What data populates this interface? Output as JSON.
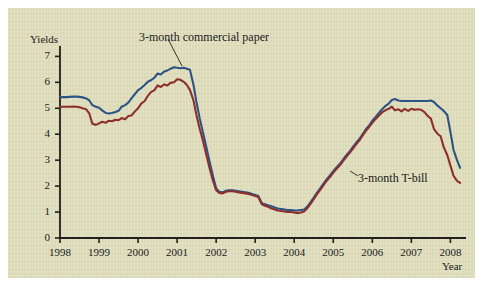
{
  "chart_data": {
    "type": "line",
    "title": "",
    "xlabel": "Year",
    "ylabel": "Yields",
    "xlim": [
      1998,
      2008.4
    ],
    "ylim": [
      0,
      7.4
    ],
    "grid": false,
    "legend_position": "inline-annotations",
    "xticks": [
      "1998",
      "1999",
      "2000",
      "2001",
      "2002",
      "2003",
      "2004",
      "2005",
      "2006",
      "2007",
      "2008"
    ],
    "yticks": [
      "0",
      "1",
      "2",
      "3",
      "4",
      "5",
      "6",
      "7"
    ],
    "annotations": [
      {
        "text": "3-month commercial paper",
        "series": "3-month commercial paper"
      },
      {
        "text": "3-month T-bill",
        "series": "3-month T-bill"
      }
    ],
    "x": [
      1998.0,
      1998.08,
      1998.17,
      1998.25,
      1998.33,
      1998.42,
      1998.5,
      1998.58,
      1998.67,
      1998.75,
      1998.83,
      1998.92,
      1999.0,
      1999.08,
      1999.17,
      1999.25,
      1999.33,
      1999.42,
      1999.5,
      1999.58,
      1999.67,
      1999.75,
      1999.83,
      1999.92,
      2000.0,
      2000.08,
      2000.17,
      2000.25,
      2000.33,
      2000.42,
      2000.5,
      2000.58,
      2000.67,
      2000.75,
      2000.83,
      2000.92,
      2001.0,
      2001.08,
      2001.17,
      2001.25,
      2001.33,
      2001.42,
      2001.5,
      2001.58,
      2001.67,
      2001.75,
      2001.83,
      2001.92,
      2002.0,
      2002.08,
      2002.17,
      2002.25,
      2002.33,
      2002.42,
      2002.5,
      2002.58,
      2002.67,
      2002.75,
      2002.83,
      2002.92,
      2003.0,
      2003.08,
      2003.17,
      2003.25,
      2003.33,
      2003.42,
      2003.5,
      2003.58,
      2003.67,
      2003.75,
      2003.83,
      2003.92,
      2004.0,
      2004.08,
      2004.17,
      2004.25,
      2004.33,
      2004.42,
      2004.5,
      2004.58,
      2004.67,
      2004.75,
      2004.83,
      2004.92,
      2005.0,
      2005.08,
      2005.17,
      2005.25,
      2005.33,
      2005.42,
      2005.5,
      2005.58,
      2005.67,
      2005.75,
      2005.83,
      2005.92,
      2006.0,
      2006.08,
      2006.17,
      2006.25,
      2006.33,
      2006.42,
      2006.5,
      2006.58,
      2006.67,
      2006.75,
      2006.83,
      2006.92,
      2007.0,
      2007.08,
      2007.17,
      2007.25,
      2007.33,
      2007.42,
      2007.5,
      2007.58,
      2007.67,
      2007.75,
      2007.83,
      2007.92,
      2008.0,
      2008.08,
      2008.17,
      2008.25
    ],
    "series": [
      {
        "name": "3-month commercial paper",
        "color": "#2b5485",
        "values": [
          5.42,
          5.43,
          5.43,
          5.44,
          5.45,
          5.45,
          5.44,
          5.42,
          5.38,
          5.3,
          5.12,
          5.06,
          5.02,
          4.92,
          4.82,
          4.8,
          4.82,
          4.86,
          4.9,
          5.06,
          5.12,
          5.22,
          5.38,
          5.55,
          5.7,
          5.78,
          5.9,
          6.02,
          6.08,
          6.18,
          6.34,
          6.3,
          6.42,
          6.46,
          6.52,
          6.58,
          6.56,
          6.54,
          6.56,
          6.52,
          6.48,
          5.9,
          5.2,
          4.6,
          4.02,
          3.5,
          2.95,
          2.38,
          1.92,
          1.78,
          1.76,
          1.82,
          1.84,
          1.84,
          1.82,
          1.8,
          1.78,
          1.76,
          1.74,
          1.7,
          1.66,
          1.62,
          1.34,
          1.3,
          1.26,
          1.22,
          1.18,
          1.14,
          1.12,
          1.1,
          1.08,
          1.08,
          1.06,
          1.06,
          1.08,
          1.1,
          1.2,
          1.38,
          1.56,
          1.74,
          1.92,
          2.1,
          2.26,
          2.42,
          2.58,
          2.72,
          2.86,
          3.02,
          3.18,
          3.34,
          3.5,
          3.66,
          3.82,
          4.0,
          4.18,
          4.34,
          4.52,
          4.66,
          4.82,
          4.96,
          5.08,
          5.18,
          5.32,
          5.36,
          5.3,
          5.28,
          5.28,
          5.28,
          5.28,
          5.28,
          5.28,
          5.28,
          5.28,
          5.28,
          5.3,
          5.24,
          5.1,
          5.0,
          4.9,
          4.74,
          4.1,
          3.4,
          3.0,
          2.7
        ]
      },
      {
        "name": "3-month T-bill",
        "color": "#8d2f2c",
        "values": [
          5.05,
          5.06,
          5.06,
          5.06,
          5.07,
          5.06,
          5.04,
          5.0,
          4.96,
          4.8,
          4.4,
          4.36,
          4.42,
          4.48,
          4.44,
          4.52,
          4.5,
          4.56,
          4.54,
          4.62,
          4.58,
          4.7,
          4.72,
          4.88,
          5.0,
          5.18,
          5.28,
          5.48,
          5.62,
          5.7,
          5.88,
          5.82,
          5.92,
          5.88,
          5.98,
          6.0,
          6.12,
          6.1,
          6.02,
          5.9,
          5.7,
          5.3,
          4.7,
          4.2,
          3.7,
          3.2,
          2.7,
          2.2,
          1.84,
          1.74,
          1.72,
          1.78,
          1.8,
          1.8,
          1.78,
          1.76,
          1.74,
          1.72,
          1.7,
          1.66,
          1.62,
          1.58,
          1.3,
          1.24,
          1.2,
          1.14,
          1.1,
          1.06,
          1.04,
          1.02,
          1.0,
          1.0,
          0.98,
          0.96,
          0.98,
          1.02,
          1.14,
          1.32,
          1.5,
          1.68,
          1.86,
          2.04,
          2.2,
          2.36,
          2.52,
          2.66,
          2.8,
          2.96,
          3.12,
          3.28,
          3.44,
          3.6,
          3.76,
          3.94,
          4.12,
          4.28,
          4.44,
          4.58,
          4.72,
          4.84,
          4.92,
          4.98,
          5.06,
          4.92,
          4.96,
          4.88,
          4.98,
          4.9,
          4.98,
          4.94,
          4.96,
          4.94,
          4.86,
          4.7,
          4.6,
          4.2,
          4.02,
          3.92,
          3.5,
          3.2,
          2.8,
          2.4,
          2.2,
          2.12
        ]
      }
    ]
  },
  "axes": {
    "y_title": "Yields",
    "x_title": "Year",
    "yticks": [
      "7",
      "6",
      "5",
      "4",
      "3",
      "2",
      "1",
      "0"
    ],
    "xticks": [
      "1998",
      "1999",
      "2000",
      "2001",
      "2002",
      "2003",
      "2004",
      "2005",
      "2006",
      "2007",
      "2008"
    ]
  },
  "labels": {
    "commercial_paper": "3-month commercial paper",
    "tbill": "3-month T-bill"
  },
  "colors": {
    "background": "#dedcba",
    "commercial_paper": "#2b5485",
    "tbill": "#8d2f2c",
    "axis": "#20201c"
  }
}
